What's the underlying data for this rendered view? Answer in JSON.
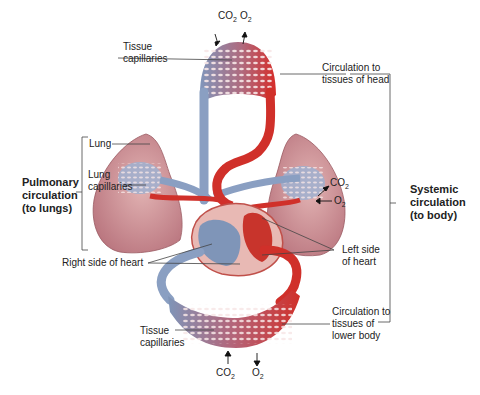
{
  "diagram": {
    "type": "circulatory-system",
    "colors": {
      "oxygenated": "#d0302a",
      "deoxygenated": "#7f95b8",
      "lung_tissue": "#c9868a",
      "heart_chamber": "#e8b9b4",
      "label_line": "#444444"
    },
    "labels": {
      "top_capillaries": "Tissue\ncapillaries",
      "top_capillaries_l1": "Tissue",
      "top_capillaries_l2": "capillaries",
      "head_circ_l1": "Circulation to",
      "head_circ_l2": "tissues of head",
      "lung": "Lung",
      "lung_caps_l1": "Lung",
      "lung_caps_l2": "capillaries",
      "pulmonary_l1": "Pulmonary",
      "pulmonary_l2": "circulation",
      "pulmonary_l3": "(to lungs)",
      "systemic_l1": "Systemic",
      "systemic_l2": "circulation",
      "systemic_l3": "(to body)",
      "left_heart_l1": "Left side",
      "left_heart_l2": "of heart",
      "right_heart": "Right side of heart",
      "bottom_capillaries_l1": "Tissue",
      "bottom_capillaries_l2": "capillaries",
      "lower_circ_l1": "Circulation to",
      "lower_circ_l2": "tissues of",
      "lower_circ_l3": "lower body"
    },
    "gases": {
      "top_co2": "CO",
      "top_o2": "O",
      "lung_co2": "CO",
      "lung_o2": "O",
      "bottom_co2": "CO",
      "bottom_o2": "O",
      "subscript": "2"
    }
  }
}
